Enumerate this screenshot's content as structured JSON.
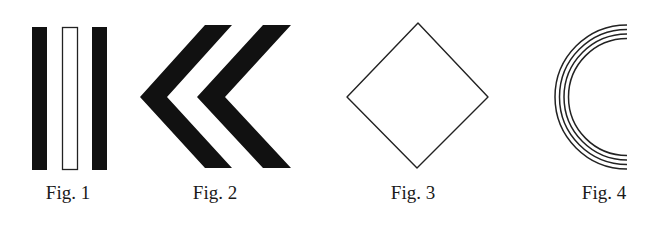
{
  "figures": [
    {
      "id": "fig1",
      "caption": "Fig. 1",
      "shape": "three-vertical-bars",
      "description": "Two solid black vertical bars flanking one outlined (hollow) vertical bar",
      "bars": [
        {
          "fill": "solid",
          "x": 32,
          "y": 27,
          "width": 15,
          "height": 143
        },
        {
          "fill": "outline",
          "x": 62,
          "y": 27,
          "width": 16,
          "height": 143
        },
        {
          "fill": "solid",
          "x": 92,
          "y": 27,
          "width": 15,
          "height": 143
        }
      ]
    },
    {
      "id": "fig2",
      "caption": "Fig. 2",
      "shape": "double-chevron-left",
      "description": "Two solid black left-pointing chevrons",
      "chevrons": [
        {
          "points": "205,25 232,25 167,97 232,168 205,168 140,97"
        },
        {
          "points": "263,25 291,25 225,97 291,168 263,168 197,97"
        }
      ]
    },
    {
      "id": "fig3",
      "caption": "Fig. 3",
      "shape": "diamond-outline",
      "description": "Thin-outlined square rotated 45 degrees",
      "points": "418,23 488,97 417,168 347,97"
    },
    {
      "id": "fig4",
      "caption": "Fig. 4",
      "shape": "concentric-semicircles",
      "description": "Four concentric thin left-half circular arcs",
      "center": {
        "x": 627,
        "y": 97
      },
      "radii": [
        72,
        67.5,
        63,
        58.5
      ]
    }
  ],
  "colors": {
    "ink": "#111111",
    "background": "#ffffff"
  }
}
